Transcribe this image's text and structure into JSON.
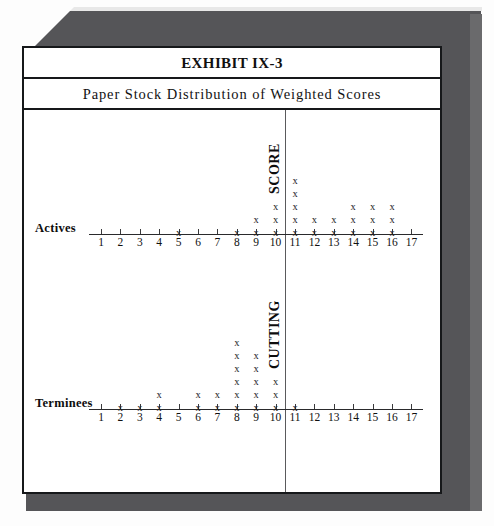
{
  "exhibit": {
    "title": "EXHIBIT IX-3",
    "subtitle": "Paper Stock Distribution of Weighted Scores"
  },
  "labels": {
    "actives": "Actives",
    "terminees": "Terminees",
    "cutting": "CUTTING",
    "score": "SCORE"
  },
  "chart_data": {
    "type": "scatter",
    "title": "Paper Stock Distribution of Weighted Scores",
    "subtitle": "EXHIBIT IX-3",
    "xlabel": "",
    "ylabel": "",
    "xlim": [
      1,
      17
    ],
    "grid": false,
    "legend": false,
    "marker": "x",
    "annotations": [
      {
        "text": "CUTTING",
        "orientation": "vertical",
        "at_x": 10.5,
        "panel": "terminees"
      },
      {
        "text": "SCORE",
        "orientation": "vertical",
        "at_x": 10.5,
        "panel": "actives"
      }
    ],
    "cutting_score_line_x": 10.5,
    "x": [
      1,
      2,
      3,
      4,
      5,
      6,
      7,
      8,
      9,
      10,
      11,
      12,
      13,
      14,
      15,
      16,
      17
    ],
    "tick_labels": [
      "1",
      "2",
      "3",
      "4",
      "5",
      "6",
      "7",
      "8",
      "9",
      "10",
      "11",
      "12",
      "13",
      "14",
      "15",
      "16",
      "17"
    ],
    "series": [
      {
        "name": "Actives",
        "counts": [
          0,
          0,
          0,
          0,
          1,
          0,
          0,
          1,
          2,
          3,
          5,
          2,
          2,
          3,
          3,
          3,
          0
        ],
        "total": 25
      },
      {
        "name": "Terminees",
        "counts": [
          0,
          1,
          1,
          2,
          0,
          2,
          2,
          6,
          5,
          3,
          1,
          0,
          0,
          0,
          0,
          0,
          0
        ],
        "total": 23
      }
    ]
  }
}
